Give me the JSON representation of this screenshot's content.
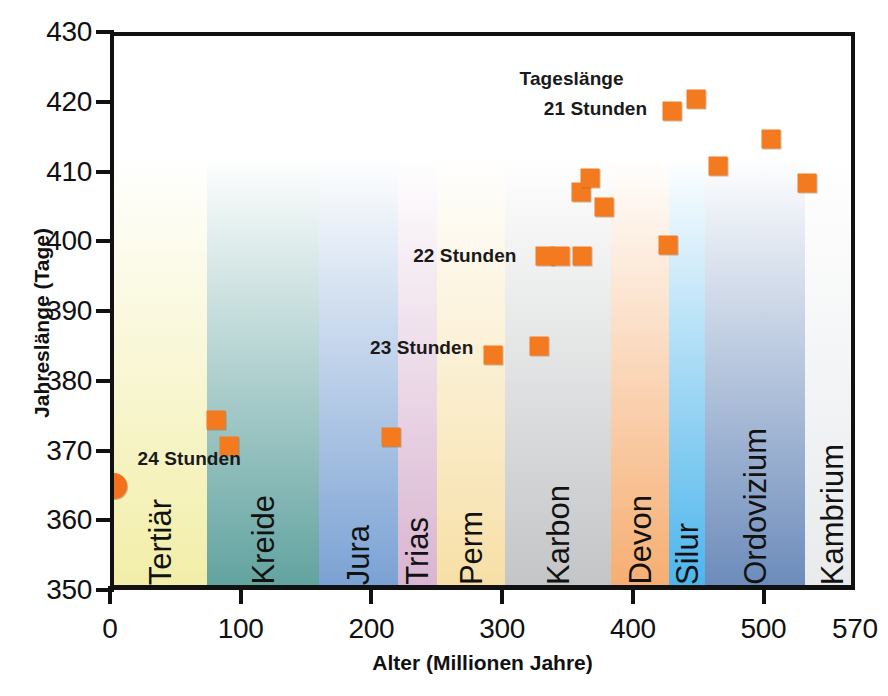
{
  "chart_data": {
    "type": "scatter",
    "title": "",
    "xlabel": "Alter (Millionen Jahre)",
    "ylabel": "Jahreslänge (Tage)",
    "xlim": [
      0,
      570
    ],
    "ylim": [
      350,
      430
    ],
    "xticks": [
      0,
      100,
      200,
      300,
      400,
      500,
      570
    ],
    "xtick_labels": [
      "0",
      "100",
      "200",
      "300",
      "400",
      "500",
      "570"
    ],
    "yticks": [
      350,
      360,
      370,
      380,
      390,
      400,
      410,
      420,
      430
    ],
    "ytick_labels": [
      "350",
      "360",
      "370",
      "380",
      "390",
      "400",
      "410",
      "420",
      "430"
    ],
    "grid": false,
    "legend": "none",
    "series": [
      {
        "name": "Jahreslänge",
        "marker": "square",
        "color": "#f47a20",
        "points": [
          {
            "x": 0,
            "y": 365.5,
            "marker": "circle"
          },
          {
            "x": 78,
            "y": 375.0
          },
          {
            "x": 88,
            "y": 371.2
          },
          {
            "x": 212,
            "y": 372.5
          },
          {
            "x": 290,
            "y": 384.3
          },
          {
            "x": 325,
            "y": 385.5
          },
          {
            "x": 330,
            "y": 398.5
          },
          {
            "x": 341,
            "y": 398.5
          },
          {
            "x": 358,
            "y": 398.5
          },
          {
            "x": 357,
            "y": 407.6
          },
          {
            "x": 364,
            "y": 409.7
          },
          {
            "x": 375,
            "y": 405.5
          },
          {
            "x": 424,
            "y": 400.0
          },
          {
            "x": 427,
            "y": 419.3
          },
          {
            "x": 445,
            "y": 421.0
          },
          {
            "x": 462,
            "y": 411.3
          },
          {
            "x": 503,
            "y": 415.3
          },
          {
            "x": 530,
            "y": 408.9
          }
        ]
      }
    ],
    "annotations": [
      {
        "text": "Tageslänge",
        "x": 390,
        "y": 423.8,
        "align": "right",
        "bold": true
      },
      {
        "text": "21 Stunden",
        "x": 408,
        "y": 419.5,
        "align": "right",
        "bold": true
      },
      {
        "text": "22 Stunden",
        "x": 308,
        "y": 398.5,
        "align": "right",
        "bold": true
      },
      {
        "text": "23 Stunden",
        "x": 275,
        "y": 385.2,
        "align": "right",
        "bold": true
      },
      {
        "text": "24 Stunden",
        "x": 18,
        "y": 369.3,
        "align": "left",
        "bold": true
      }
    ],
    "bands": [
      {
        "label": "Tertiär",
        "x0": 0,
        "x1": 71,
        "color": "#f2eea8"
      },
      {
        "label": "Kreide",
        "x0": 71,
        "x1": 157,
        "color": "#62a3a0"
      },
      {
        "label": "Jura",
        "x0": 157,
        "x1": 217,
        "color": "#7ba2d4"
      },
      {
        "label": "Trias",
        "x0": 217,
        "x1": 247,
        "color": "#d9b5d1"
      },
      {
        "label": "Perm",
        "x0": 247,
        "x1": 299,
        "color": "#f7dfa6"
      },
      {
        "label": "Karbon",
        "x0": 299,
        "x1": 380,
        "color": "#c3c5c6"
      },
      {
        "label": "Devon",
        "x0": 380,
        "x1": 425,
        "color": "#f6ae72"
      },
      {
        "label": "Silur",
        "x0": 425,
        "x1": 452,
        "color": "#4db5ec"
      },
      {
        "label": "Ordovizium",
        "x0": 452,
        "x1": 529,
        "color": "#6d8cbb"
      },
      {
        "label": "Kambrium",
        "x0": 529,
        "x1": 570,
        "color": "#e8eaec"
      }
    ]
  },
  "caption": {
    "stub": ""
  }
}
